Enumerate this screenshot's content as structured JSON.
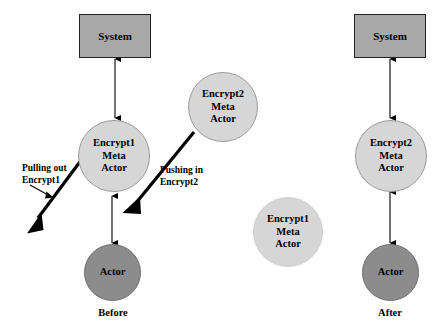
{
  "diagram": {
    "title_text": "",
    "background_color": "#ffffff",
    "colors": {
      "system_box_fill": "#a8a8a8",
      "meta_actor_fill": "#d6d6d6",
      "actor_fill": "#8c8c8c",
      "stroke": "#000000",
      "box_border": "#222222",
      "circle_border": "#9a9a9a"
    }
  },
  "before_panel": {
    "caption": "Before",
    "system_label": "System",
    "encrypt1": {
      "line1": "Encrypt1",
      "line2": "Meta",
      "line3": "Actor"
    },
    "encrypt2_incoming": {
      "line1": "Encrypt2",
      "line2": "Meta",
      "line3": "Actor"
    },
    "actor_label": "Actor",
    "annotations": {
      "pull": {
        "line1": "Pulling out",
        "line2": "Encrypt1"
      },
      "push": {
        "line1": "Pushing in",
        "line2": "Encrypt2"
      }
    }
  },
  "detached": {
    "encrypt1": {
      "line1": "Encrypt1",
      "line2": "Meta",
      "line3": "Actor"
    }
  },
  "after_panel": {
    "caption": "After",
    "system_label": "System",
    "encrypt2": {
      "line1": "Encrypt2",
      "line2": "Meta",
      "line3": "Actor"
    },
    "actor_label": "Actor"
  }
}
